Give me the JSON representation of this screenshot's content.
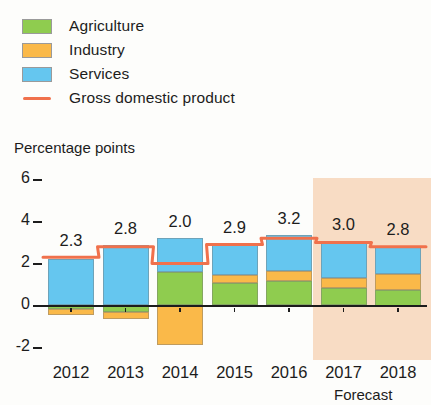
{
  "legend": {
    "items": [
      {
        "label": "Agriculture",
        "type": "swatch",
        "color": "#8fcc4f",
        "name": "agriculture"
      },
      {
        "label": "Industry",
        "type": "swatch",
        "color": "#fab949",
        "name": "industry"
      },
      {
        "label": "Services",
        "type": "swatch",
        "color": "#65c6ef",
        "name": "services"
      },
      {
        "label": "Gross domestic product",
        "type": "line",
        "color": "#f0714c",
        "name": "gdp"
      }
    ]
  },
  "axis_title": "Percentage points",
  "forecast_note": "Forecast",
  "colors": {
    "agriculture": "#8fcc4f",
    "industry": "#fab949",
    "services": "#65c6ef",
    "gdp_line": "#f0714c",
    "forecast_band": "#f7d9bf",
    "axis": "#1c1c1c"
  },
  "chart_data": {
    "type": "bar",
    "title": "",
    "subtitle": "",
    "xlabel": "",
    "ylabel": "Percentage points",
    "ylim": [
      -2,
      6
    ],
    "yticks": [
      6,
      4,
      2,
      0,
      -2
    ],
    "ytick_labels": [
      "6",
      "4",
      "2",
      "0",
      "-2"
    ],
    "grid": false,
    "stacked": true,
    "legend_position": "top-left",
    "categories": [
      "2012",
      "2013",
      "2014",
      "2015",
      "2016",
      "2017",
      "2018"
    ],
    "series": [
      {
        "name": "Agriculture",
        "color": "#8fcc4f",
        "values": [
          -0.15,
          -0.3,
          1.6,
          1.05,
          1.15,
          0.85,
          0.75
        ]
      },
      {
        "name": "Industry",
        "color": "#fab949",
        "values": [
          -0.3,
          -0.35,
          -1.9,
          0.4,
          0.5,
          0.45,
          0.75
        ]
      },
      {
        "name": "Services",
        "color": "#65c6ef",
        "values": [
          2.2,
          2.9,
          1.6,
          1.5,
          1.7,
          1.75,
          1.35
        ]
      }
    ],
    "line_series": {
      "name": "Gross domestic product",
      "color": "#f0714c",
      "values": [
        2.3,
        2.8,
        2.0,
        2.9,
        3.2,
        3.0,
        2.8
      ]
    },
    "data_labels": [
      "2.3",
      "2.8",
      "2.0",
      "2.9",
      "3.2",
      "3.0",
      "2.8"
    ],
    "annotations": [
      {
        "text": "Forecast",
        "covers": [
          "2017",
          "2018"
        ]
      }
    ]
  }
}
